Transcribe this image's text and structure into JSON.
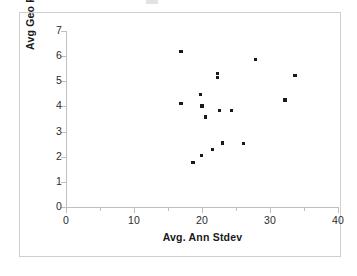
{
  "chart_data": {
    "type": "scatter",
    "title": "",
    "xlabel": "Avg. Ann Stdev",
    "ylabel": "Avg Geo Return",
    "xlim": [
      0,
      40
    ],
    "ylim": [
      0,
      7
    ],
    "x_ticks": [
      "0",
      "10",
      "20",
      "30",
      "40"
    ],
    "x_tick_values": [
      0,
      10,
      20,
      30,
      40
    ],
    "x_minor_tick_values": [
      5,
      15,
      25,
      35
    ],
    "y_ticks": [
      "0",
      "1",
      "2",
      "3",
      "4",
      "5",
      "6",
      "7"
    ],
    "y_tick_values": [
      0,
      1,
      2,
      3,
      4,
      5,
      6,
      7
    ],
    "grid": false,
    "legend": false,
    "marker_color": "#1a1a1a",
    "marker_shape": "square",
    "points": [
      {
        "x": 16.9,
        "y": 6.18
      },
      {
        "x": 27.9,
        "y": 5.87
      },
      {
        "x": 22.3,
        "y": 5.32
      },
      {
        "x": 22.3,
        "y": 5.16
      },
      {
        "x": 33.7,
        "y": 5.24
      },
      {
        "x": 19.8,
        "y": 4.48
      },
      {
        "x": 32.2,
        "y": 4.25
      },
      {
        "x": 16.9,
        "y": 4.12
      },
      {
        "x": 20.0,
        "y": 4.02
      },
      {
        "x": 22.6,
        "y": 3.83
      },
      {
        "x": 24.3,
        "y": 3.83
      },
      {
        "x": 20.5,
        "y": 3.58
      },
      {
        "x": 23.0,
        "y": 2.55
      },
      {
        "x": 26.1,
        "y": 2.53
      },
      {
        "x": 21.5,
        "y": 2.29
      },
      {
        "x": 19.9,
        "y": 2.05
      },
      {
        "x": 18.7,
        "y": 1.78
      }
    ]
  },
  "axes": {
    "y_title": "Avg Geo Return",
    "x_title": "Avg. Ann Stdev"
  }
}
